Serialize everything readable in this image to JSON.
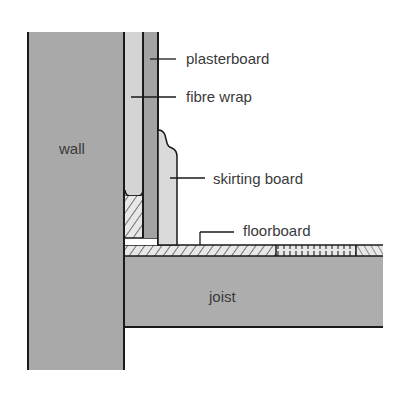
{
  "diagram": {
    "type": "cross-section",
    "labels": {
      "wall": "wall",
      "plasterboard": "plasterboard",
      "fibre_wrap": "fibre wrap",
      "skirting_board": "skirting board",
      "floorboard": "floorboard",
      "joist": "joist"
    },
    "colors": {
      "wall": "#a9a9a9",
      "fibre_wrap": "#d4d4d4",
      "plasterboard": "#a3a3a3",
      "skirting_board": "#dadada",
      "joist": "#adadad",
      "outline": "#1a1a1a",
      "text": "#3a3a3a"
    }
  }
}
